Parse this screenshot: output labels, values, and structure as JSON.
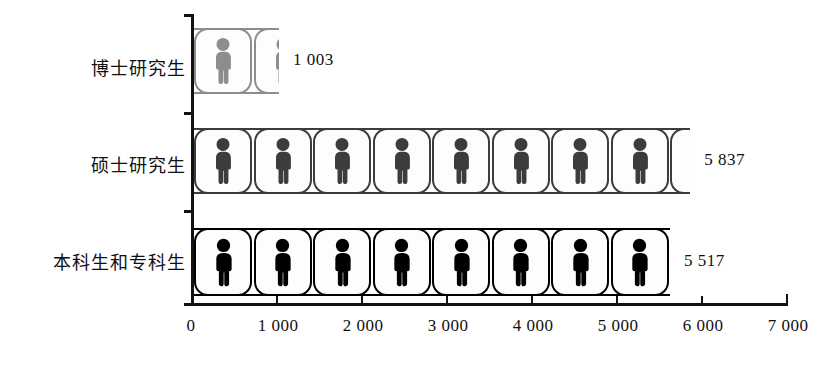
{
  "chart_data": {
    "type": "bar",
    "subtype": "pictogram-horizontal-bar",
    "title": "",
    "xlabel": "",
    "ylabel": "",
    "categories": [
      "博士研究生",
      "硕士研究生",
      "本科生和专科生"
    ],
    "values": [
      1003,
      5837,
      5517
    ],
    "value_labels": [
      "1 003",
      "5 837",
      "5 517"
    ],
    "xlim": [
      0,
      7000
    ],
    "xticks": [
      0,
      1000,
      2000,
      3000,
      4000,
      5000,
      6000,
      7000
    ],
    "xtick_labels": [
      "0",
      "1 000",
      "2 000",
      "3 000",
      "4 000",
      "5 000",
      "6 000",
      "7 000"
    ],
    "grid": false,
    "legend": false,
    "icon_unit_value": 700,
    "icon": "person-icon",
    "series_colors": [
      "#8a8a8a",
      "#3a3a3a",
      "#000000"
    ]
  },
  "axis": {
    "x_tick_labels": [
      "0",
      "1 000",
      "2 000",
      "3 000",
      "4 000",
      "5 000",
      "6 000",
      "7 000"
    ]
  },
  "rows": [
    {
      "label": "博士研究生",
      "value_label": "1 003",
      "value": 1003,
      "color": "#8d8d8d",
      "full_icons": 1,
      "partial_fraction": 0.43
    },
    {
      "label": "硕士研究生",
      "value_label": "5 837",
      "value": 5837,
      "color": "#3c3c3c",
      "full_icons": 8,
      "partial_fraction": 0.34
    },
    {
      "label": "本科生和专科生",
      "value_label": "5 517",
      "value": 5517,
      "color": "#000000",
      "full_icons": 8,
      "partial_fraction": 0.0
    }
  ]
}
